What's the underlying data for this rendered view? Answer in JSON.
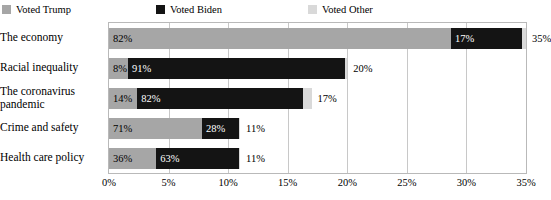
{
  "legend": {
    "items": [
      {
        "label": "Voted Trump",
        "color": "#a6a6a6",
        "key": "trump"
      },
      {
        "label": "Voted Biden",
        "color": "#141414",
        "key": "biden"
      },
      {
        "label": "Voted Other",
        "color": "#d9d9d9",
        "key": "other"
      }
    ]
  },
  "chart_data": {
    "type": "bar",
    "subtype": "stacked-horizontal",
    "title": "",
    "xlabel": "",
    "ylabel": "",
    "xlim": [
      0,
      35
    ],
    "grid": true,
    "legend_position": "top-left",
    "tick_labels": [
      "0%",
      "5%",
      "10%",
      "15%",
      "20%",
      "25%",
      "30%",
      "35%"
    ],
    "tick_values": [
      0,
      5,
      10,
      15,
      20,
      25,
      30,
      35
    ],
    "categories": [
      "The economy",
      "Racial inequality",
      "The coronavirus pandemic",
      "Crime and safety",
      "Health care policy"
    ],
    "totals": [
      35,
      20,
      17,
      11,
      11
    ],
    "total_labels": [
      "35%",
      "20%",
      "17%",
      "11%",
      "11%"
    ],
    "series": [
      {
        "name": "Voted Trump",
        "key": "trump",
        "color": "#a6a6a6",
        "values": [
          82,
          8,
          14,
          71,
          36
        ],
        "labels": [
          "82%",
          "8%",
          "14%",
          "71%",
          "36%"
        ]
      },
      {
        "name": "Voted Biden",
        "key": "biden",
        "color": "#141414",
        "values": [
          17,
          91,
          82,
          28,
          63
        ],
        "labels": [
          "17%",
          "91%",
          "82%",
          "28%",
          "63%"
        ]
      },
      {
        "name": "Voted Other",
        "key": "other",
        "color": "#d9d9d9",
        "values": [
          1,
          1,
          4,
          1,
          1
        ],
        "labels": [
          "",
          "",
          "",
          "",
          ""
        ]
      }
    ]
  }
}
